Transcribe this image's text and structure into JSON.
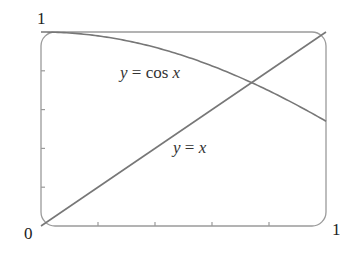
{
  "chart_data": {
    "type": "line",
    "title": "",
    "xlabel": "",
    "ylabel": "",
    "xlim": [
      0,
      1
    ],
    "ylim": [
      0,
      1
    ],
    "grid": false,
    "legend": null,
    "x_tick_labels": {
      "min": "0",
      "max": "1"
    },
    "y_tick_labels": {
      "max": "1"
    },
    "x_minor_ticks": [
      0.2,
      0.4,
      0.6,
      0.8
    ],
    "y_minor_ticks": [
      0.2,
      0.4,
      0.6,
      0.8
    ],
    "series": [
      {
        "name": "y = cos x",
        "function": "cos",
        "x": [
          0,
          0.1,
          0.2,
          0.3,
          0.4,
          0.5,
          0.6,
          0.7,
          0.8,
          0.9,
          1.0
        ],
        "values": [
          1.0,
          0.995,
          0.98,
          0.955,
          0.921,
          0.878,
          0.825,
          0.765,
          0.697,
          0.622,
          0.54
        ]
      },
      {
        "name": "y = x",
        "function": "identity",
        "x": [
          0,
          1
        ],
        "values": [
          0,
          1
        ]
      }
    ],
    "annotations": [
      {
        "text": "y = cos x",
        "x": 0.47,
        "y": 0.8
      },
      {
        "text": "y = x",
        "x": 0.62,
        "y": 0.35
      }
    ],
    "intersection": {
      "x": 0.739,
      "y": 0.739
    }
  },
  "labels": {
    "origin": "0",
    "x_max": "1",
    "y_max": "1",
    "cos_label_var_y": "y",
    "cos_label_eq": " = cos ",
    "cos_label_var_x": "x",
    "line_label_var_y": "y",
    "line_label_eq": " = ",
    "line_label_var_x": "x"
  },
  "colors": {
    "frame": "#9a9a9a",
    "curve": "#777777",
    "text": "#222222"
  }
}
